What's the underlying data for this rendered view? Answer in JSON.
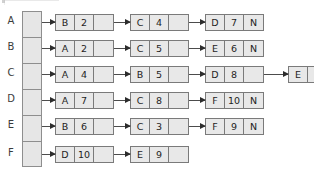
{
  "diagram": {
    "nil_symbol": "N",
    "colors": {
      "cell_fill": "#e8e8e8",
      "cell_border": "#7a7a7a",
      "array_fill": "#e6e6e6",
      "array_border": "#8e8e8e",
      "arrow": "#2c2c2c",
      "text": "#1e1e1e",
      "label": "#3b3b3b",
      "background": "#ffffff"
    },
    "array_labels": [
      "A",
      "B",
      "C",
      "D",
      "E",
      "F"
    ],
    "rows": [
      {
        "label": "A",
        "nodes": [
          {
            "key": "B",
            "value": "2",
            "ptr": ""
          },
          {
            "key": "C",
            "value": "4",
            "ptr": ""
          },
          {
            "key": "D",
            "value": "7",
            "ptr": "N"
          }
        ]
      },
      {
        "label": "B",
        "nodes": [
          {
            "key": "A",
            "value": "2",
            "ptr": ""
          },
          {
            "key": "C",
            "value": "5",
            "ptr": ""
          },
          {
            "key": "E",
            "value": "6",
            "ptr": "N"
          }
        ]
      },
      {
        "label": "C",
        "nodes": [
          {
            "key": "A",
            "value": "4",
            "ptr": ""
          },
          {
            "key": "B",
            "value": "5",
            "ptr": ""
          },
          {
            "key": "D",
            "value": "8",
            "ptr": ""
          },
          {
            "key": "E",
            "value": "3",
            "ptr": "N"
          }
        ]
      },
      {
        "label": "D",
        "nodes": [
          {
            "key": "A",
            "value": "7",
            "ptr": ""
          },
          {
            "key": "C",
            "value": "8",
            "ptr": ""
          },
          {
            "key": "F",
            "value": "10",
            "ptr": "N"
          }
        ]
      },
      {
        "label": "E",
        "nodes": [
          {
            "key": "B",
            "value": "6",
            "ptr": ""
          },
          {
            "key": "C",
            "value": "3",
            "ptr": ""
          },
          {
            "key": "F",
            "value": "9",
            "ptr": "N"
          }
        ]
      },
      {
        "label": "F",
        "nodes": [
          {
            "key": "D",
            "value": "10",
            "ptr": ""
          },
          {
            "key": "E",
            "value": "9",
            "ptr": ""
          }
        ]
      }
    ]
  }
}
